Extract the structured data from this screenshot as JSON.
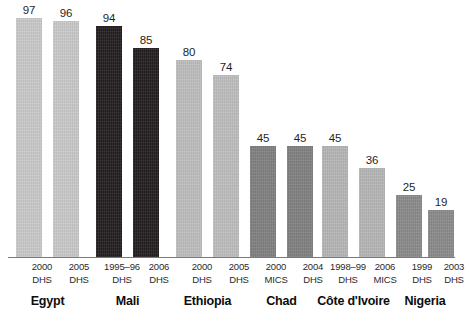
{
  "chart_data": {
    "type": "bar",
    "title": "",
    "xlabel": "",
    "ylabel": "",
    "ylim": [
      0,
      100
    ],
    "grid": false,
    "legend": "none",
    "categories": [
      "Egypt 2000 DHS",
      "Egypt 2005 DHS",
      "Mali 1995-96 DHS",
      "Mali 2006 DHS",
      "Ethiopia 2000 DHS",
      "Ethiopia 2005 DHS",
      "Chad 2000 MICS",
      "Chad 2004 DHS",
      "Côte d'Ivoire 1998–99 DHS",
      "Côte d'Ivoire 2006 MICS",
      "Nigeria 1999 DHS",
      "Nigeria 2003 DHS"
    ],
    "values": [
      97,
      96,
      94,
      85,
      80,
      74,
      45,
      45,
      45,
      36,
      25,
      19
    ],
    "groups": [
      {
        "country": "Egypt",
        "color": "#c8c8c8",
        "bars": [
          {
            "value": 97,
            "value_label": "97",
            "year": "2000",
            "survey": "DHS"
          },
          {
            "value": 96,
            "value_label": "96",
            "year": "2005",
            "survey": "DHS"
          }
        ]
      },
      {
        "country": "Mali",
        "color": "#231f20",
        "bars": [
          {
            "value": 94,
            "value_label": "94",
            "year": "1995–96",
            "survey": "DHS"
          },
          {
            "value": 85,
            "value_label": "85",
            "year": "2006",
            "survey": "DHS"
          }
        ]
      },
      {
        "country": "Ethiopia",
        "color": "#bdbdbd",
        "bars": [
          {
            "value": 80,
            "value_label": "80",
            "year": "2000",
            "survey": "DHS"
          },
          {
            "value": 74,
            "value_label": "74",
            "year": "2005",
            "survey": "DHS"
          }
        ]
      },
      {
        "country": "Chad",
        "color": "#808080",
        "bars": [
          {
            "value": 45,
            "value_label": "45",
            "year": "2000",
            "survey": "MICS"
          },
          {
            "value": 45,
            "value_label": "45",
            "year": "2004",
            "survey": "DHS"
          }
        ]
      },
      {
        "country": "Côte d'Ivoire",
        "color": "#b5b5b5",
        "bars": [
          {
            "value": 45,
            "value_label": "45",
            "year": "1998–99",
            "survey": "DHS"
          },
          {
            "value": 36,
            "value_label": "36",
            "year": "2006",
            "survey": "MICS"
          }
        ]
      },
      {
        "country": "Nigeria",
        "color": "#8a8a8a",
        "bars": [
          {
            "value": 25,
            "value_label": "25",
            "year": "1999",
            "survey": "DHS"
          },
          {
            "value": 19,
            "value_label": "19",
            "year": "2003",
            "survey": "DHS"
          }
        ]
      }
    ]
  },
  "layout": {
    "baseline_y": 257,
    "bar_width": 26,
    "value_max": 100,
    "pixels_per_unit": 2.46,
    "bar_x": [
      16,
      53,
      96,
      133,
      176,
      213,
      250,
      287,
      322,
      359,
      396,
      428
    ],
    "axis_color": "#7a7a7a"
  }
}
